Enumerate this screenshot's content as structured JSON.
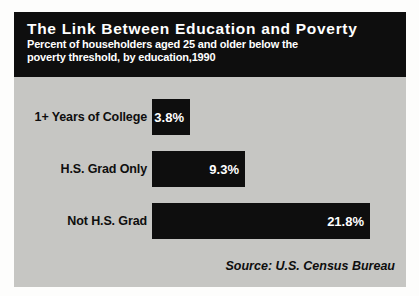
{
  "colors": {
    "ink_black": "#0e0e0e",
    "panel_gray": "#c6c6c3",
    "text_white": "#ffffff",
    "page_background": "#fdfdfc"
  },
  "chart_data": {
    "type": "bar",
    "orientation": "horizontal",
    "title": "The Link Between Education and Poverty",
    "subtitle_lines": [
      "Percent of householders aged 25 and older below the",
      "poverty threshold, by education,1990"
    ],
    "categories": [
      "1+ Years of College",
      "H.S. Grad Only",
      "Not H.S. Grad"
    ],
    "values": [
      3.8,
      9.3,
      21.8
    ],
    "value_labels": [
      "3.8%",
      "9.3%",
      "21.8%"
    ],
    "unit": "percent",
    "xlim": [
      0,
      25
    ],
    "bar_color": "#0e0e0e",
    "value_label_position": "inside-right",
    "grid": false,
    "legend": false,
    "source": "Source: U.S. Census Bureau"
  }
}
